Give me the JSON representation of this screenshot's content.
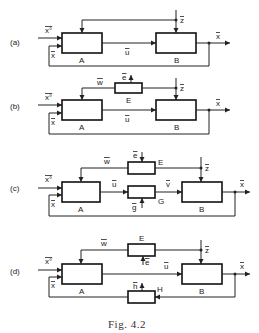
{
  "figure": {
    "caption": "Fig. 4.2",
    "panels": [
      {
        "id": "a",
        "label": "(a)",
        "blocks": [
          {
            "name": "A"
          },
          {
            "name": "B"
          }
        ],
        "signals": {
          "input": "x°",
          "feedback": "x",
          "control": "u",
          "disturbance": "z",
          "output": "x"
        }
      },
      {
        "id": "b",
        "label": "(b)",
        "blocks": [
          {
            "name": "A"
          },
          {
            "name": "E"
          },
          {
            "name": "B"
          }
        ],
        "signals": {
          "input": "x°",
          "feedback": "x",
          "control": "u",
          "estimate": "w",
          "e": "e",
          "disturbance": "z",
          "output": "x"
        }
      },
      {
        "id": "c",
        "label": "(c)",
        "blocks": [
          {
            "name": "A"
          },
          {
            "name": "E"
          },
          {
            "name": "G"
          },
          {
            "name": "B"
          }
        ],
        "signals": {
          "input": "x°",
          "feedback": "x",
          "control": "u",
          "actuated": "v",
          "estimate": "w",
          "e": "e",
          "g": "g",
          "disturbance": "z",
          "output": "x"
        }
      },
      {
        "id": "d",
        "label": "(d)",
        "blocks": [
          {
            "name": "A"
          },
          {
            "name": "E"
          },
          {
            "name": "H"
          },
          {
            "name": "B"
          }
        ],
        "signals": {
          "input": "x°",
          "feedback": "x",
          "control": "u",
          "estimate": "w",
          "e": "e",
          "h": "h",
          "disturbance": "z",
          "output": "x"
        }
      }
    ]
  }
}
